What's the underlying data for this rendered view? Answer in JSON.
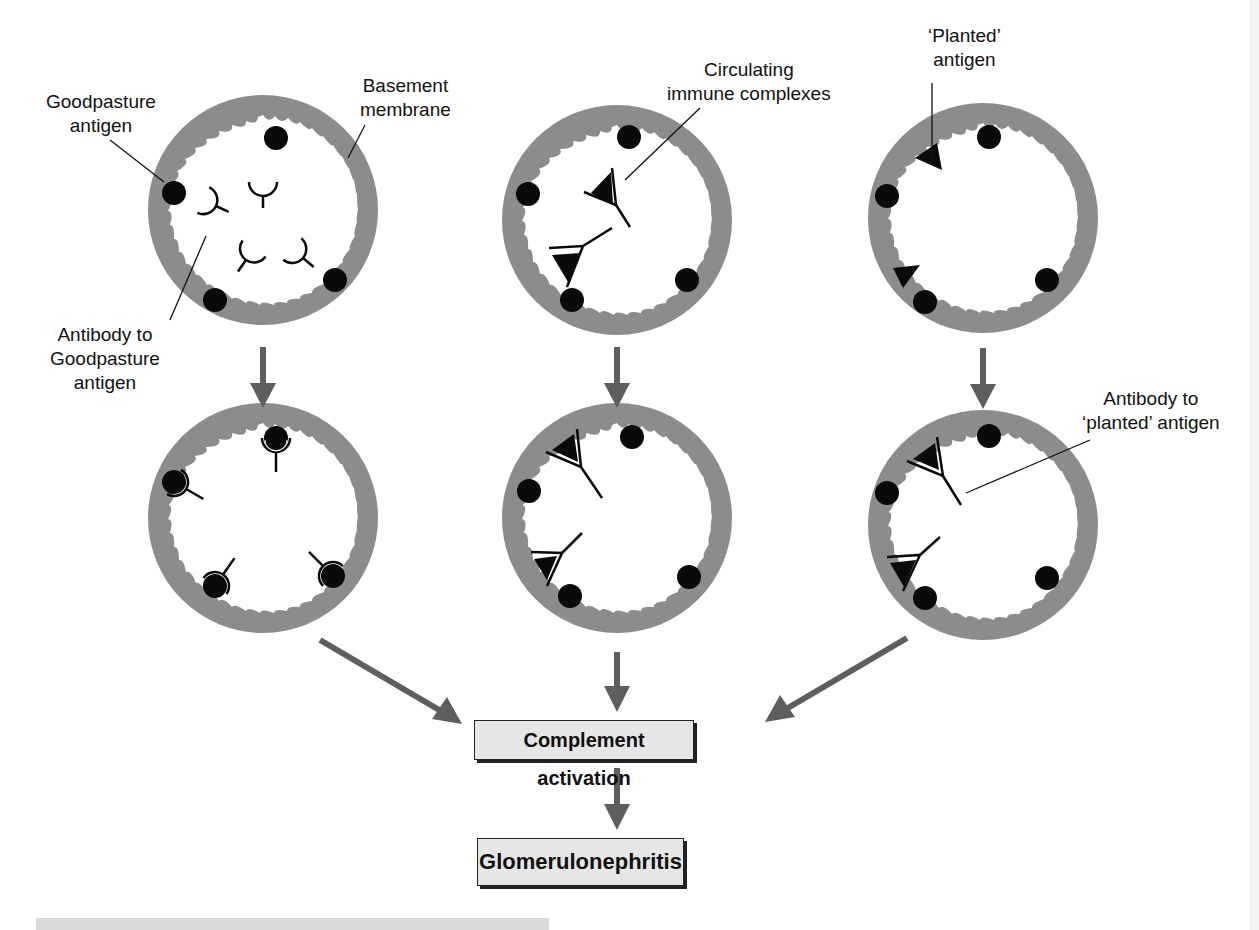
{
  "figure": {
    "columns": [
      {
        "id": "anti-gbm",
        "top_state": "free antibodies near Goodpasture antigen",
        "bottom_state": "antibodies bound to Goodpasture antigen"
      },
      {
        "id": "circulating-ic",
        "top_state": "circulating immune complexes",
        "bottom_state": "immune complexes deposited"
      },
      {
        "id": "planted",
        "top_state": "planted antigen in membrane",
        "bottom_state": "antibody bound to planted antigen"
      }
    ],
    "labels": {
      "goodpasture_antigen_l1": "Goodpasture",
      "goodpasture_antigen_l2": "antigen",
      "basement_membrane_l1": "Basement",
      "basement_membrane_l2": "membrane",
      "antibody_gp_l1": "Antibody to",
      "antibody_gp_l2": "Goodpasture",
      "antibody_gp_l3": "antigen",
      "circulating_l1": "Circulating",
      "circulating_l2": "immune complexes",
      "planted_l1": "‘Planted’",
      "planted_l2": "antigen",
      "antibody_planted_l1": "Antibody to",
      "antibody_planted_l2": "‘planted’ antigen"
    },
    "boxes": {
      "complement": "Complement activation",
      "outcome": "Glomerulonephritis"
    },
    "colors": {
      "membrane": "#8c8c8c",
      "arrow": "#5e5e5e",
      "antigen": "#0a0a0a",
      "box_fill": "#e6e6e6"
    }
  }
}
